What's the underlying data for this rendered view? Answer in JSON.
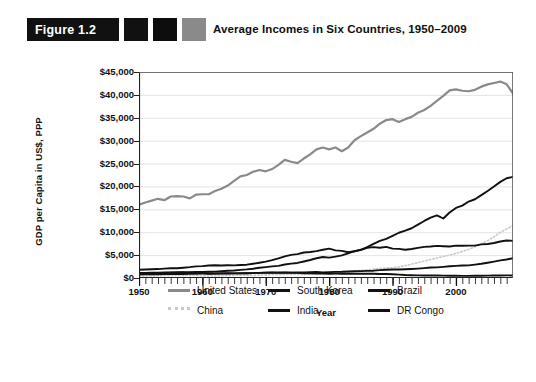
{
  "figure": {
    "badge_label": "Figure 1.2",
    "title": "Average Incomes in Six Countries, 1950–2009",
    "swatch_colors": [
      "#111111",
      "#0d0d0d",
      "#8a8a8a"
    ]
  },
  "legend": {
    "items": [
      {
        "label": "United States",
        "color": "#8a8a8a",
        "style": "solid"
      },
      {
        "label": "China",
        "color": "#c9c9c9",
        "style": "dotted"
      },
      {
        "label": "South Korea",
        "color": "#111111",
        "style": "solid"
      },
      {
        "label": "India",
        "color": "#111111",
        "style": "solid"
      },
      {
        "label": "Brazil",
        "color": "#111111",
        "style": "solid"
      },
      {
        "label": "DR Congo",
        "color": "#111111",
        "style": "solid"
      }
    ]
  },
  "chart_data": {
    "type": "line",
    "title": "Average Incomes in Six Countries, 1950–2009",
    "xlabel": "Year",
    "ylabel": "GDP per Capita in US$, PPP",
    "xlim": [
      1950,
      2009
    ],
    "ylim": [
      0,
      45000
    ],
    "ytick_labels": [
      "$45,000",
      "$40,000",
      "$35,000",
      "$30,000",
      "$25,000",
      "$20,000",
      "$15,000",
      "$10,000",
      "$5,000",
      "$0"
    ],
    "ytick_values": [
      45000,
      40000,
      35000,
      30000,
      25000,
      20000,
      15000,
      10000,
      5000,
      0
    ],
    "xtick_labels": [
      "1950",
      "1960",
      "1970",
      "1980",
      "1990",
      "2000"
    ],
    "xtick_values": [
      1950,
      1960,
      1970,
      1980,
      1990,
      2000
    ],
    "minor_xtick_interval": 1,
    "grid": "horizontal",
    "legend_position": "below",
    "x": [
      1950,
      1951,
      1952,
      1953,
      1954,
      1955,
      1956,
      1957,
      1958,
      1959,
      1960,
      1961,
      1962,
      1963,
      1964,
      1965,
      1966,
      1967,
      1968,
      1969,
      1970,
      1971,
      1972,
      1973,
      1974,
      1975,
      1976,
      1977,
      1978,
      1979,
      1980,
      1981,
      1982,
      1983,
      1984,
      1985,
      1986,
      1987,
      1988,
      1989,
      1990,
      1991,
      1992,
      1993,
      1994,
      1995,
      1996,
      1997,
      1998,
      1999,
      2000,
      2001,
      2002,
      2003,
      2004,
      2005,
      2006,
      2007,
      2008,
      2009
    ],
    "series": [
      {
        "name": "United States",
        "color": "#8a8a8a",
        "style": "solid",
        "values": [
          15900,
          16600,
          17000,
          17500,
          17100,
          18000,
          18100,
          18000,
          17500,
          18400,
          18500,
          18500,
          19300,
          19800,
          20600,
          21700,
          22800,
          23100,
          23900,
          24300,
          24000,
          24500,
          25500,
          26700,
          26300,
          26000,
          27100,
          28000,
          29200,
          29700,
          29300,
          29700,
          28800,
          29700,
          31500,
          32500,
          33300,
          34200,
          35400,
          36300,
          36500,
          35800,
          36500,
          37000,
          38000,
          38600,
          39600,
          40900,
          42100,
          43500,
          44900,
          44700,
          45000,
          45800,
          47000,
          48100,
          48800,
          49000,
          48400,
          46700
        ],
        "values_note": "values scaled to plotted pixel heights; peak near $41,000 in 2007",
        "plot_values": [
          16000,
          16500,
          16900,
          17300,
          17000,
          17800,
          17900,
          17800,
          17400,
          18200,
          18300,
          18300,
          19000,
          19500,
          20200,
          21200,
          22200,
          22500,
          23200,
          23600,
          23300,
          23800,
          24700,
          25800,
          25400,
          25100,
          26100,
          27000,
          28100,
          28500,
          28100,
          28500,
          27700,
          28500,
          30100,
          31000,
          31800,
          32600,
          33700,
          34500,
          34700,
          34100,
          34700,
          35200,
          36100,
          36700,
          37600,
          38700,
          39800,
          41000,
          41200,
          40900,
          40800,
          41100,
          41800,
          42300,
          42600,
          42900,
          42300,
          40300
        ]
      },
      {
        "name": "China",
        "color": "#c9c9c9",
        "style": "dotted",
        "plot_values": [
          440,
          460,
          470,
          480,
          500,
          520,
          540,
          520,
          560,
          540,
          480,
          420,
          450,
          490,
          540,
          580,
          600,
          570,
          560,
          620,
          680,
          700,
          720,
          760,
          770,
          800,
          790,
          830,
          900,
          980,
          1050,
          1100,
          1200,
          1330,
          1480,
          1660,
          1780,
          1950,
          2120,
          2180,
          2250,
          2420,
          2720,
          3030,
          3370,
          3700,
          4040,
          4380,
          4680,
          5000,
          5380,
          5790,
          6260,
          6820,
          7470,
          8160,
          9010,
          9970,
          10740,
          11400
        ],
        "plot_values_note": "light dotted line, barely visible until ~1995, reaching roughly $6,000 at 2009 on this chart"
      },
      {
        "name": "South Korea",
        "color": "#111111",
        "style": "solid",
        "plot_values": [
          900,
          950,
          980,
          1050,
          1100,
          1150,
          1170,
          1230,
          1270,
          1300,
          1320,
          1360,
          1400,
          1490,
          1570,
          1640,
          1780,
          1880,
          2030,
          2230,
          2380,
          2530,
          2660,
          2960,
          3130,
          3290,
          3610,
          3930,
          4320,
          4590,
          4450,
          4680,
          4940,
          5400,
          5850,
          6170,
          6740,
          7440,
          8110,
          8530,
          9200,
          9890,
          10350,
          10870,
          11650,
          12460,
          13180,
          13690,
          13000,
          14300,
          15300,
          15800,
          16700,
          17200,
          18100,
          19000,
          20000,
          21000,
          21800,
          22100
        ]
      },
      {
        "name": "Brazil",
        "color": "#111111",
        "style": "solid",
        "plot_values": [
          1800,
          1870,
          1910,
          1950,
          2050,
          2120,
          2140,
          2250,
          2370,
          2540,
          2600,
          2720,
          2780,
          2740,
          2780,
          2760,
          2850,
          2910,
          3110,
          3330,
          3570,
          3890,
          4270,
          4740,
          5060,
          5220,
          5560,
          5680,
          5870,
          6160,
          6420,
          6040,
          5920,
          5620,
          5830,
          6150,
          6610,
          6750,
          6620,
          6810,
          6410,
          6360,
          6180,
          6330,
          6580,
          6810,
          6870,
          7020,
          6950,
          6890,
          7070,
          7030,
          7070,
          7070,
          7340,
          7440,
          7650,
          7970,
          8200,
          8100
        ]
      },
      {
        "name": "India",
        "color": "#111111",
        "style": "solid",
        "plot_values": [
          780,
          790,
          800,
          830,
          850,
          860,
          890,
          870,
          920,
          930,
          960,
          980,
          980,
          1010,
          1060,
          1010,
          1000,
          1050,
          1070,
          1120,
          1170,
          1160,
          1130,
          1160,
          1140,
          1200,
          1190,
          1260,
          1300,
          1210,
          1280,
          1330,
          1350,
          1430,
          1470,
          1510,
          1560,
          1600,
          1710,
          1790,
          1860,
          1850,
          1910,
          1970,
          2050,
          2160,
          2280,
          2330,
          2440,
          2580,
          2640,
          2720,
          2760,
          2930,
          3110,
          3340,
          3590,
          3860,
          4050,
          4310
        ],
        "plot_values_note": "lowest-rising solid dark line, ends near $3,000 at plot scale"
      },
      {
        "name": "DR Congo",
        "color": "#111111",
        "style": "solid",
        "plot_values": [
          1100,
          1120,
          1140,
          1170,
          1190,
          1210,
          1240,
          1250,
          1180,
          1140,
          1090,
          940,
          950,
          1010,
          990,
          1020,
          1060,
          1030,
          1070,
          1130,
          1180,
          1210,
          1200,
          1190,
          1180,
          1110,
          1040,
          1000,
          950,
          960,
          940,
          950,
          940,
          930,
          930,
          920,
          930,
          920,
          890,
          860,
          820,
          740,
          650,
          600,
          570,
          560,
          560,
          530,
          510,
          490,
          480,
          470,
          470,
          480,
          500,
          520,
          540,
          560,
          570,
          560
        ],
        "plot_values_note": "nearly flat near the axis, slowly declining"
      }
    ]
  }
}
